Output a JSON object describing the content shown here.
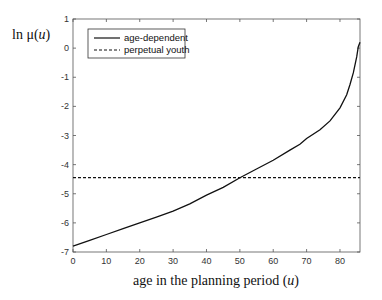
{
  "chart_data": {
    "type": "line",
    "title": "",
    "xlabel": "age in the planning period (u)",
    "ylabel": "ln μ(u)",
    "xlim": [
      0,
      86
    ],
    "ylim": [
      -7,
      1
    ],
    "xticks": [
      0,
      10,
      20,
      30,
      40,
      50,
      60,
      70,
      80
    ],
    "yticks": [
      1,
      0,
      -1,
      -2,
      -3,
      -4,
      -5,
      -6,
      -7
    ],
    "grid": false,
    "legend_position": "upper left",
    "series": [
      {
        "name": "age-dependent",
        "style": "solid",
        "color": "#111111",
        "x": [
          0,
          5,
          10,
          15,
          20,
          25,
          30,
          35,
          40,
          45,
          50,
          55,
          60,
          65,
          68,
          70,
          74,
          77,
          80,
          82,
          83,
          84,
          85,
          85.5,
          86
        ],
        "y": [
          -6.8,
          -6.6,
          -6.4,
          -6.2,
          -6.0,
          -5.8,
          -5.6,
          -5.35,
          -5.05,
          -4.78,
          -4.45,
          -4.15,
          -3.85,
          -3.5,
          -3.3,
          -3.1,
          -2.8,
          -2.5,
          -2.05,
          -1.6,
          -1.25,
          -0.85,
          -0.3,
          0.05,
          0.2
        ]
      },
      {
        "name": "perpetual youth",
        "style": "dashed",
        "color": "#111111",
        "x": [
          0,
          86
        ],
        "y": [
          -4.45,
          -4.45
        ]
      }
    ]
  }
}
